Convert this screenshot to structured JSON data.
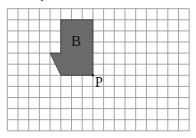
{
  "diagram": {
    "type": "grid-shape",
    "grid": {
      "columns": 17,
      "rows": 11,
      "origin_px": [
        7.3,
        8.7
      ],
      "cell_w_px": 10.7,
      "cell_h_px": 11.1,
      "line_color": "#9a9a9a",
      "background": "#ffffff"
    },
    "shape": {
      "name": "B",
      "fill": "#6b6b6b",
      "stroke": "#333333",
      "vertices_grid": [
        [
          5,
          1
        ],
        [
          8,
          1
        ],
        [
          8,
          6
        ],
        [
          5,
          6
        ],
        [
          4,
          4
        ],
        [
          5,
          4
        ]
      ]
    },
    "labels": {
      "shape_label": "B",
      "point_label": "P"
    },
    "point": {
      "name": "P",
      "grid": [
        8,
        6
      ]
    }
  }
}
